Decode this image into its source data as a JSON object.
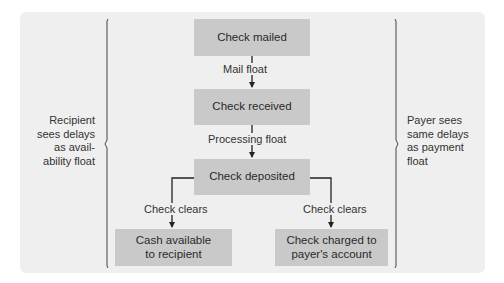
{
  "diagram": {
    "nodes": {
      "check_mailed": "Check mailed",
      "check_received": "Check received",
      "check_deposited": "Check deposited",
      "cash_available_l1": "Cash available",
      "cash_available_l2": "to recipient",
      "check_charged_l1": "Check charged to",
      "check_charged_l2": "payer's account"
    },
    "edges": {
      "mail_float": "Mail float",
      "processing_float": "Processing float",
      "check_clears_left": "Check clears",
      "check_clears_right": "Check clears"
    },
    "left_annotation": [
      "Recipient",
      "sees delays",
      "as avail-",
      "ability float"
    ],
    "right_annotation": [
      "Payer sees",
      "same delays",
      "as payment",
      "float"
    ],
    "colors": {
      "panel": "#efefef",
      "box": "#c9c9c9",
      "line": "#222222"
    }
  }
}
